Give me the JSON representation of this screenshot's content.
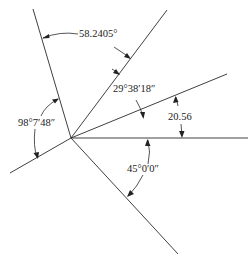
{
  "diagram": {
    "type": "angle-dimension-drawing",
    "vertex": {
      "x": 71,
      "y": 138
    },
    "colors": {
      "line": "#2a2a2a",
      "text": "#222222",
      "background": "#ffffff"
    },
    "rays": [
      {
        "id": "ray-upper-left",
        "x2": 33,
        "y2": 9
      },
      {
        "id": "ray-upper-right",
        "x2": 167,
        "y2": 10
      },
      {
        "id": "ray-right-upper",
        "x2": 227,
        "y2": 74
      },
      {
        "id": "ray-horizontal",
        "x2": 248,
        "y2": 138
      },
      {
        "id": "ray-lower-left",
        "x2": 10,
        "y2": 173
      },
      {
        "id": "ray-lower-right",
        "x2": 178,
        "y2": 254
      }
    ],
    "dimensions": [
      {
        "id": "angle-58",
        "label": "58.2405°",
        "between": [
          "ray-upper-left",
          "ray-upper-right"
        ]
      },
      {
        "id": "angle-29",
        "label": "29°38′18″",
        "between": [
          "ray-upper-right",
          "ray-right-upper"
        ]
      },
      {
        "id": "angle-20",
        "label": "20.56",
        "between": [
          "ray-right-upper",
          "ray-horizontal"
        ]
      },
      {
        "id": "angle-98",
        "label": "98°7′48″",
        "between": [
          "ray-upper-left",
          "ray-lower-left"
        ]
      },
      {
        "id": "angle-45",
        "label": "45°0′0″",
        "between": [
          "ray-horizontal",
          "ray-lower-right"
        ]
      }
    ]
  }
}
